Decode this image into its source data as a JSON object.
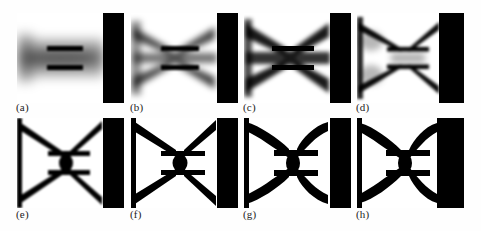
{
  "figure": {
    "type": "image-grid",
    "caption_style": "lettered",
    "rows": 2,
    "columns": 4,
    "background_color": "#ffffff",
    "material_color": "#000000",
    "void_color": "#ffffff",
    "support_color": "#000000"
  },
  "panels": [
    {
      "id": "panel-a",
      "label": "(a)",
      "iteration_index": 1,
      "blur_px": 5.2,
      "contrast": 0.42,
      "gray_level": 0.55,
      "arm_thickness": 2.0,
      "arm_opacity": 0.3,
      "bar_opacity": 1.0,
      "core_opacity": 0.12,
      "support_width_pct": 19,
      "state": "diffuse grey density field with two solid horizontal bars"
    },
    {
      "id": "panel-b",
      "label": "(b)",
      "iteration_index": 2,
      "blur_px": 3.4,
      "contrast": 0.62,
      "gray_level": 0.4,
      "arm_thickness": 5.5,
      "arm_opacity": 0.72,
      "bar_opacity": 1.0,
      "core_opacity": 0.35,
      "support_width_pct": 19,
      "state": "diagonal arms emerging from the grey field"
    },
    {
      "id": "panel-c",
      "label": "(c)",
      "iteration_index": 3,
      "blur_px": 2.3,
      "contrast": 0.78,
      "gray_level": 0.26,
      "arm_thickness": 7.5,
      "arm_opacity": 0.88,
      "bar_opacity": 1.0,
      "core_opacity": 0.52,
      "support_width_pct": 19,
      "state": "arms thickening, X topology clearly visible"
    },
    {
      "id": "panel-d",
      "label": "(d)",
      "iteration_index": 4,
      "blur_px": 1.5,
      "contrast": 0.88,
      "gray_level": 0.16,
      "arm_thickness": 6.2,
      "arm_opacity": 0.95,
      "bar_opacity": 1.0,
      "core_opacity": 0.3,
      "support_width_pct": 23,
      "state": "thin crisp outline of bow-tie members, interior greying out"
    },
    {
      "id": "panel-e",
      "label": "(e)",
      "iteration_index": 5,
      "blur_px": 0.9,
      "contrast": 0.96,
      "gray_level": 0.05,
      "arm_thickness": 8.0,
      "arm_opacity": 1.0,
      "bar_opacity": 1.0,
      "core_opacity": 1.0,
      "support_width_pct": 19,
      "state": "near black-and-white X-brace with central ellipse"
    },
    {
      "id": "panel-f",
      "label": "(f)",
      "iteration_index": 6,
      "blur_px": 0.7,
      "contrast": 0.98,
      "gray_level": 0.03,
      "arm_thickness": 9.0,
      "arm_opacity": 1.0,
      "bar_opacity": 1.0,
      "core_opacity": 1.0,
      "support_width_pct": 19,
      "state": "members thicken toward the corners"
    },
    {
      "id": "panel-g",
      "label": "(g)",
      "iteration_index": 7,
      "blur_px": 0.4,
      "contrast": 1.0,
      "gray_level": 0.01,
      "arm_thickness": 11.0,
      "arm_opacity": 1.0,
      "bar_opacity": 1.0,
      "core_opacity": 1.0,
      "support_width_pct": 19,
      "state": "fully discrete design, tapered lens-shaped arms"
    },
    {
      "id": "panel-h",
      "label": "(h)",
      "iteration_index": 8,
      "blur_px": 0.3,
      "contrast": 1.0,
      "gray_level": 0.0,
      "arm_thickness": 11.5,
      "arm_opacity": 1.0,
      "bar_opacity": 1.0,
      "core_opacity": 1.0,
      "support_width_pct": 25,
      "state": "converged optimal topology against widened support wall"
    }
  ]
}
